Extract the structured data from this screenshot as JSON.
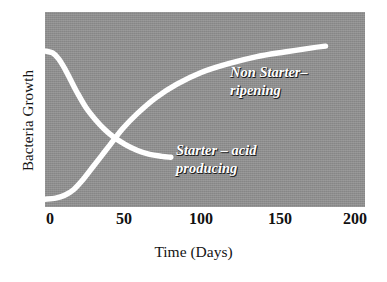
{
  "chart": {
    "type": "line",
    "title": "",
    "xlabel": "Time (Days)",
    "ylabel": "Bacteria Growth",
    "background_color": "#909090",
    "line_color": "#ffffff",
    "x_ticks": [
      "0",
      "50",
      "100",
      "150",
      "200"
    ],
    "x_tick_values": [
      0,
      50,
      100,
      150,
      200
    ],
    "y_ticks": [],
    "grid": false,
    "legend_position": "inline-on-plot"
  },
  "series": [
    {
      "name": "non-starter",
      "label_line1": "Non Starter–",
      "label_line2": "ripening",
      "color": "#ffffff"
    },
    {
      "name": "starter",
      "label_line1": "Starter – acid",
      "label_line2": "producing",
      "color": "#ffffff"
    }
  ],
  "chart_data": {
    "type": "line",
    "title": "",
    "xlabel": "Time (Days)",
    "ylabel": "Bacteria Growth",
    "xlim": [
      -3,
      208
    ],
    "ylim": [
      0,
      100
    ],
    "grid": false,
    "legend_position": "inline-on-plot",
    "x_tick_labels": [
      "0",
      "50",
      "100",
      "150",
      "200"
    ],
    "x_tick_values": [
      0,
      50,
      100,
      150,
      200
    ],
    "y_tick_labels": [],
    "annotations": [
      {
        "text": "Non Starter– ripening",
        "x": 128,
        "y": 70
      },
      {
        "text": "Starter – acid producing",
        "x": 92,
        "y": 32
      }
    ],
    "series": [
      {
        "name": "Starter – acid producing",
        "color": "#ffffff",
        "x": [
          -3,
          2,
          6,
          10,
          14,
          18,
          24,
          30,
          36,
          42,
          50,
          58,
          66,
          74,
          80
        ],
        "y": [
          80,
          79,
          76,
          71,
          65,
          59,
          51,
          45,
          40,
          36,
          32,
          29,
          27,
          26,
          25.5
        ]
      },
      {
        "name": "Non Starter– ripening",
        "color": "#ffffff",
        "x": [
          -3,
          4,
          10,
          16,
          22,
          28,
          34,
          40,
          48,
          58,
          70,
          84,
          100,
          118,
          136,
          155,
          172,
          182
        ],
        "y": [
          4,
          4.5,
          6,
          9,
          14,
          20,
          26,
          32,
          40,
          48,
          56,
          63,
          69,
          73.5,
          77,
          79.5,
          81.5,
          82.5
        ]
      }
    ]
  }
}
